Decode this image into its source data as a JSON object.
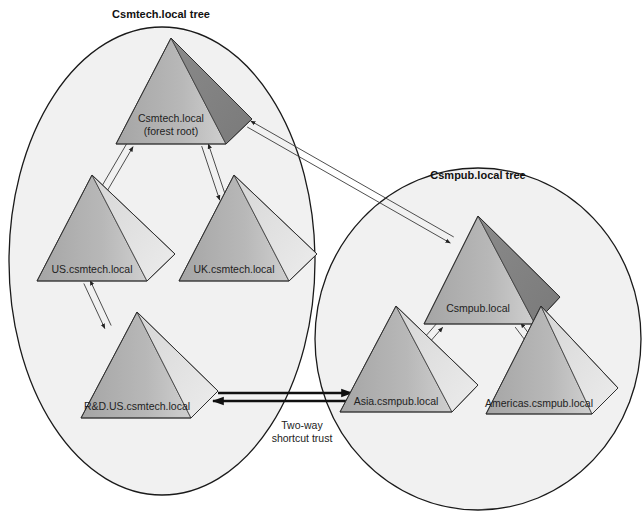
{
  "diagram": {
    "trees": [
      {
        "id": "csmtech",
        "title": "Csmtech.local tree",
        "title_pos": [
          161,
          18
        ],
        "ellipse": {
          "cx": 162,
          "cy": 261,
          "rx": 153,
          "ry": 234
        }
      },
      {
        "id": "csmpub",
        "title": "Csmpub.local tree",
        "title_pos": [
          478,
          179
        ],
        "ellipse": {
          "cx": 478,
          "cy": 339,
          "rx": 163,
          "ry": 171
        }
      }
    ],
    "nodes": [
      {
        "id": "csmtech",
        "label": "Csmtech.local",
        "label2": "(forest root)",
        "apex": [
          171,
          38
        ],
        "bl": [
          116,
          144
        ],
        "br": [
          226,
          144
        ],
        "rt": [
          252,
          119
        ],
        "label_pos": [
          171,
          128
        ]
      },
      {
        "id": "us",
        "label": "US.csmtech.local",
        "apex": [
          92,
          175
        ],
        "bl": [
          37,
          281
        ],
        "br": [
          147,
          281
        ],
        "rt": [
          175,
          254
        ],
        "label_pos": [
          92,
          273
        ]
      },
      {
        "id": "uk",
        "label": "UK.csmtech.local",
        "apex": [
          234,
          175
        ],
        "bl": [
          179,
          281
        ],
        "br": [
          289,
          281
        ],
        "rt": [
          317,
          254
        ],
        "label_pos": [
          234,
          273
        ]
      },
      {
        "id": "rd",
        "label": "R&D.US.csmtech.local",
        "apex": [
          137,
          312
        ],
        "bl": [
          81,
          418
        ],
        "br": [
          191,
          418
        ],
        "rt": [
          218,
          391
        ],
        "label_pos": [
          137,
          410
        ]
      },
      {
        "id": "csmpub",
        "label": "Csmpub.local",
        "apex": [
          478,
          216
        ],
        "bl": [
          424,
          324
        ],
        "br": [
          535,
          324
        ],
        "rt": [
          560,
          297
        ],
        "label_pos": [
          478,
          312
        ]
      },
      {
        "id": "asia",
        "label": "Asia.csmpub.local",
        "apex": [
          396,
          380
        ],
        "bl": [
          340,
          412
        ],
        "br": [
          452,
          412
        ],
        "rt": [
          478,
          385
        ],
        "label_pos": [
          396,
          405
        ],
        "_note": "apex adjusted below"
      },
      {
        "id": "americas",
        "label": "Americas.csmpub.local",
        "apex": [
          541,
          380
        ],
        "bl": [
          486,
          414
        ],
        "br": [
          592,
          414
        ],
        "rt": [
          618,
          388
        ],
        "label_pos": [
          539,
          407
        ]
      }
    ],
    "trusts": [
      {
        "from": "csmtech",
        "to": "us",
        "type": "two-way-parent-child"
      },
      {
        "from": "csmtech",
        "to": "uk",
        "type": "two-way-parent-child"
      },
      {
        "from": "us",
        "to": "rd",
        "type": "two-way-parent-child"
      },
      {
        "from": "csmtech",
        "to": "csmpub",
        "type": "two-way-tree-root"
      },
      {
        "from": "csmpub",
        "to": "asia",
        "type": "two-way-parent-child"
      },
      {
        "from": "csmpub",
        "to": "americas",
        "type": "two-way-parent-child"
      },
      {
        "from": "rd",
        "to": "asia",
        "type": "two-way-shortcut",
        "label": "Two-way",
        "label2": "shortcut trust"
      }
    ],
    "shortcut_label": {
      "line1": "Two-way",
      "line2": "shortcut trust",
      "pos": [
        302,
        429
      ]
    },
    "colors": {
      "ellipse_fill": "#efefef",
      "ellipse_stroke": "#1a1a1a",
      "face_front_top": "#c4c4c4",
      "face_front_bottom": "#9a9a9a",
      "face_side_light": "#dedede",
      "face_side_dark": "#8c8c8c",
      "edge_stroke": "#3a3a3a",
      "arrow": "#222222"
    }
  }
}
